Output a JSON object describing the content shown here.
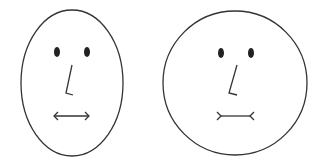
{
  "figure": {
    "stroke_color": "#333333",
    "fill_color": "#ffffff",
    "faces": [
      {
        "id": "left",
        "head_shape": "ellipse",
        "mouth_style": "arrowheads-outward"
      },
      {
        "id": "right",
        "head_shape": "circle",
        "mouth_style": "fins-inward"
      }
    ]
  }
}
